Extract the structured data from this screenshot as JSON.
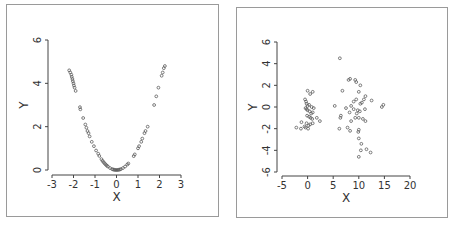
{
  "chart_data": [
    {
      "type": "scatter",
      "title": "",
      "xlabel": "X",
      "ylabel": "Y",
      "xlim": [
        -3,
        3
      ],
      "ylim": [
        0,
        6
      ],
      "xticks": [
        -3,
        -2,
        -1,
        0,
        1,
        2,
        3
      ],
      "yticks": [
        0,
        2,
        4,
        6
      ],
      "grid": false,
      "legend": null,
      "points": [
        [
          -2.2,
          4.6
        ],
        [
          -2.15,
          4.5
        ],
        [
          -2.1,
          4.4
        ],
        [
          -2.08,
          4.3
        ],
        [
          -2.05,
          4.2
        ],
        [
          -2.03,
          4.1
        ],
        [
          -2.0,
          4.0
        ],
        [
          -1.98,
          3.9
        ],
        [
          -1.95,
          3.8
        ],
        [
          -1.9,
          3.65
        ],
        [
          -1.7,
          2.9
        ],
        [
          -1.68,
          2.8
        ],
        [
          -1.55,
          2.4
        ],
        [
          -1.45,
          2.1
        ],
        [
          -1.4,
          1.95
        ],
        [
          -1.35,
          1.8
        ],
        [
          -1.3,
          1.7
        ],
        [
          -1.25,
          1.55
        ],
        [
          -1.15,
          1.3
        ],
        [
          -1.05,
          1.1
        ],
        [
          -0.95,
          0.9
        ],
        [
          -0.85,
          0.75
        ],
        [
          -0.8,
          0.65
        ],
        [
          -0.7,
          0.5
        ],
        [
          -0.65,
          0.42
        ],
        [
          -0.6,
          0.36
        ],
        [
          -0.55,
          0.3
        ],
        [
          -0.5,
          0.25
        ],
        [
          -0.45,
          0.2
        ],
        [
          -0.4,
          0.16
        ],
        [
          -0.3,
          0.09
        ],
        [
          -0.2,
          0.04
        ],
        [
          -0.15,
          0.02
        ],
        [
          -0.1,
          0.01
        ],
        [
          -0.05,
          0.0
        ],
        [
          0.0,
          0.0
        ],
        [
          0.05,
          0.0
        ],
        [
          0.1,
          0.01
        ],
        [
          0.15,
          0.02
        ],
        [
          0.2,
          0.04
        ],
        [
          0.3,
          0.09
        ],
        [
          0.4,
          0.16
        ],
        [
          0.5,
          0.25
        ],
        [
          0.55,
          0.3
        ],
        [
          0.8,
          0.64
        ],
        [
          0.85,
          0.72
        ],
        [
          1.0,
          1.0
        ],
        [
          1.05,
          1.1
        ],
        [
          1.15,
          1.3
        ],
        [
          1.2,
          1.45
        ],
        [
          1.3,
          1.7
        ],
        [
          1.35,
          1.8
        ],
        [
          1.45,
          2.0
        ],
        [
          1.75,
          3.0
        ],
        [
          1.85,
          3.4
        ],
        [
          1.95,
          3.8
        ],
        [
          2.1,
          4.35
        ],
        [
          2.15,
          4.5
        ],
        [
          2.2,
          4.7
        ],
        [
          2.25,
          4.8
        ]
      ]
    },
    {
      "type": "scatter",
      "title": "",
      "xlabel": "X",
      "ylabel": "Y",
      "xlim": [
        -5,
        20
      ],
      "ylim": [
        -6,
        6
      ],
      "xticks": [
        -5,
        0,
        5,
        10,
        15,
        20
      ],
      "yticks": [
        -6,
        -4,
        -2,
        0,
        2,
        4,
        6
      ],
      "grid": false,
      "legend": null,
      "points": [
        [
          0.0,
          1.5
        ],
        [
          0.5,
          1.2
        ],
        [
          1.0,
          1.4
        ],
        [
          -0.5,
          0.7
        ],
        [
          -0.3,
          0.5
        ],
        [
          -0.2,
          0.3
        ],
        [
          0.0,
          0.1
        ],
        [
          0.3,
          0.2
        ],
        [
          0.8,
          0.0
        ],
        [
          1.2,
          -0.1
        ],
        [
          -0.4,
          -0.1
        ],
        [
          -0.2,
          -0.2
        ],
        [
          0.0,
          -0.3
        ],
        [
          0.4,
          -0.4
        ],
        [
          0.7,
          -0.6
        ],
        [
          1.0,
          -0.5
        ],
        [
          -0.1,
          -0.8
        ],
        [
          0.3,
          -0.9
        ],
        [
          0.6,
          -1.0
        ],
        [
          0.9,
          -1.1
        ],
        [
          1.8,
          -1.0
        ],
        [
          2.4,
          -1.3
        ],
        [
          -0.2,
          -1.5
        ],
        [
          0.2,
          -1.7
        ],
        [
          0.5,
          -1.6
        ],
        [
          1.0,
          -1.5
        ],
        [
          -1.2,
          -1.4
        ],
        [
          -2.2,
          -1.9
        ],
        [
          -1.3,
          -2.0
        ],
        [
          -0.6,
          -1.8
        ],
        [
          -0.4,
          -1.9
        ],
        [
          0.1,
          -2.0
        ],
        [
          6.3,
          4.5
        ],
        [
          8.0,
          2.5
        ],
        [
          8.3,
          2.6
        ],
        [
          9.3,
          2.5
        ],
        [
          9.5,
          2.3
        ],
        [
          10.3,
          2.0
        ],
        [
          6.8,
          1.5
        ],
        [
          10.0,
          1.4
        ],
        [
          11.3,
          1.0
        ],
        [
          12.5,
          0.6
        ],
        [
          11.0,
          0.7
        ],
        [
          9.5,
          0.7
        ],
        [
          9.0,
          0.5
        ],
        [
          10.6,
          0.4
        ],
        [
          10.3,
          0.3
        ],
        [
          5.3,
          0.1
        ],
        [
          14.8,
          0.2
        ],
        [
          14.5,
          0.0
        ],
        [
          8.5,
          0.1
        ],
        [
          7.5,
          -0.1
        ],
        [
          9.0,
          -0.2
        ],
        [
          9.8,
          -0.3
        ],
        [
          11.2,
          -0.2
        ],
        [
          8.2,
          -0.5
        ],
        [
          9.6,
          -0.6
        ],
        [
          10.2,
          -0.4
        ],
        [
          6.5,
          -0.8
        ],
        [
          6.4,
          -1.0
        ],
        [
          9.3,
          -1.0
        ],
        [
          10.0,
          -1.0
        ],
        [
          10.8,
          -1.1
        ],
        [
          11.3,
          -1.3
        ],
        [
          8.5,
          -1.3
        ],
        [
          7.8,
          -1.9
        ],
        [
          6.2,
          -2.0
        ],
        [
          8.3,
          -2.2
        ],
        [
          10.0,
          -2.1
        ],
        [
          9.9,
          -2.3
        ],
        [
          10.0,
          -2.9
        ],
        [
          10.5,
          -3.4
        ],
        [
          11.5,
          -3.9
        ],
        [
          10.4,
          -4.0
        ],
        [
          12.3,
          -4.2
        ],
        [
          10.0,
          -4.6
        ]
      ]
    }
  ],
  "panels": {
    "left": {
      "xlabel": "X",
      "ylabel": "Y",
      "xtick_labels": [
        "-3",
        "-2",
        "-1",
        "0",
        "1",
        "2",
        "3"
      ],
      "ytick_labels": [
        "0",
        "2",
        "4",
        "6"
      ]
    },
    "right": {
      "xlabel": "X",
      "ylabel": "Y",
      "xtick_labels": [
        "-5",
        "0",
        "5",
        "10",
        "15",
        "20"
      ],
      "ytick_labels": [
        "-6",
        "-4",
        "-2",
        "0",
        "2",
        "4",
        "6"
      ]
    }
  },
  "colors": {
    "point": "#555555",
    "axis": "#444444",
    "frame": "#9a9a9a"
  }
}
